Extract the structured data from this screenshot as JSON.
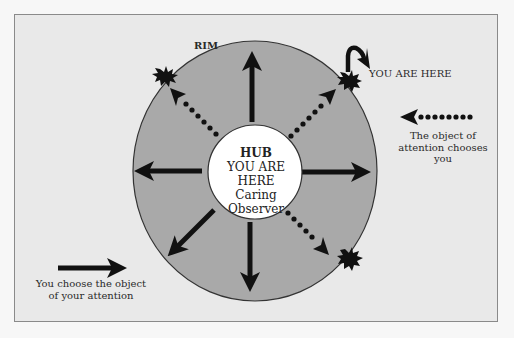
{
  "diagram": {
    "rim_label": "RIM",
    "hub": {
      "title": "HUB",
      "line1": "YOU ARE HERE",
      "line2": "Caring",
      "line3": "Observer"
    },
    "you_are_here_label": "YOU ARE HERE",
    "right_caption": {
      "line1": "The object of",
      "line2": "attention chooses you"
    },
    "left_caption": {
      "line1": "You choose the object",
      "line2": "of your attention"
    },
    "colors": {
      "background": "#e9e9e9",
      "rim_fill": "#a9a9a9",
      "hub_fill": "#ffffff",
      "arrow": "#111111"
    }
  }
}
